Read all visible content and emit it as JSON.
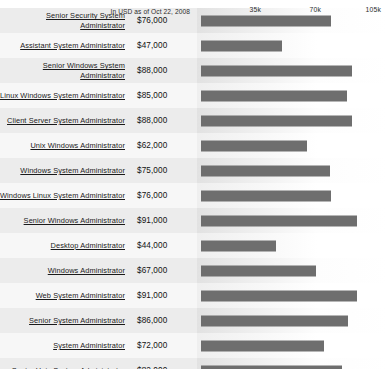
{
  "chart_data": {
    "type": "bar",
    "title": "",
    "orientation": "horizontal",
    "xlabel": "",
    "ylabel": "",
    "xlim": [
      0,
      105000
    ],
    "grid": false,
    "legend": null,
    "tick_labels": [
      "35k",
      "70k",
      "105k"
    ],
    "tick_values": [
      35000,
      70000,
      105000
    ],
    "footnote": "In USD as of Oct 22, 2008",
    "bar_color": "#6e6e6e",
    "categories": [
      "Senior Security System Administrator",
      "Assistant System Administrator",
      "Senior Windows System Administrator",
      "Linux Windows System Administrator",
      "Client Server System Administrator",
      "Unix Windows Administrator",
      "Windows System Administrator",
      "Windows Linux System Administrator",
      "Senior Windows Administrator",
      "Desktop Administrator",
      "Windows Administrator",
      "Web System Administrator",
      "Senior System Administrator",
      "System Administrator",
      "Senior Unix System Administrator"
    ],
    "values": [
      76000,
      47000,
      88000,
      85000,
      88000,
      62000,
      75000,
      76000,
      91000,
      44000,
      67000,
      91000,
      86000,
      72000,
      82000
    ],
    "value_labels": [
      "$76,000",
      "$47,000",
      "$88,000",
      "$85,000",
      "$88,000",
      "$62,000",
      "$75,000",
      "$76,000",
      "$91,000",
      "$44,000",
      "$67,000",
      "$91,000",
      "$86,000",
      "$72,000",
      "$82,000"
    ]
  },
  "rows": [
    {
      "label": "Senior Security System Administrator",
      "value_label": "$76,000",
      "value": 76000
    },
    {
      "label": "Assistant System Administrator",
      "value_label": "$47,000",
      "value": 47000
    },
    {
      "label": "Senior Windows System Administrator",
      "value_label": "$88,000",
      "value": 88000
    },
    {
      "label": "Linux Windows System Administrator",
      "value_label": "$85,000",
      "value": 85000
    },
    {
      "label": "Client Server System Administrator",
      "value_label": "$88,000",
      "value": 88000
    },
    {
      "label": "Unix Windows Administrator",
      "value_label": "$62,000",
      "value": 62000
    },
    {
      "label": "Windows System Administrator",
      "value_label": "$75,000",
      "value": 75000
    },
    {
      "label": "Windows Linux System Administrator",
      "value_label": "$76,000",
      "value": 76000
    },
    {
      "label": "Senior Windows Administrator",
      "value_label": "$91,000",
      "value": 91000
    },
    {
      "label": "Desktop Administrator",
      "value_label": "$44,000",
      "value": 44000
    },
    {
      "label": "Windows Administrator",
      "value_label": "$67,000",
      "value": 67000
    },
    {
      "label": "Web System Administrator",
      "value_label": "$91,000",
      "value": 91000
    },
    {
      "label": "Senior System Administrator",
      "value_label": "$86,000",
      "value": 86000
    },
    {
      "label": "System Administrator",
      "value_label": "$72,000",
      "value": 72000
    },
    {
      "label": "Senior Unix System Administrator",
      "value_label": "$82,000",
      "value": 82000
    }
  ],
  "axis": {
    "note": "In USD as of Oct 22, 2008",
    "ticks": [
      "35k",
      "70k",
      "105k"
    ]
  }
}
